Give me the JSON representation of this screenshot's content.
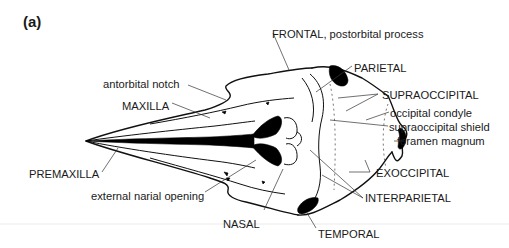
{
  "figure": {
    "panel_label": "(a)",
    "labels": {
      "frontal": "FRONTAL, postorbital process",
      "parietal": "PARIETAL",
      "supraoccipital": "SUPRAOCCIPITAL",
      "occipital_condyle": "occipital condyle",
      "supraoccipital_shield": "supraoccipital shield",
      "foramen_magnum": "foramen magnum",
      "exoccipital": "EXOCCIPITAL",
      "interparietal": "INTERPARIETAL",
      "temporal": "TEMPORAL",
      "nasal": "NASAL",
      "external_narial_opening": "external narial opening",
      "premaxilla": "PREMAXILLA",
      "maxilla": "MAXILLA",
      "antorbital_notch": "antorbital notch"
    }
  }
}
